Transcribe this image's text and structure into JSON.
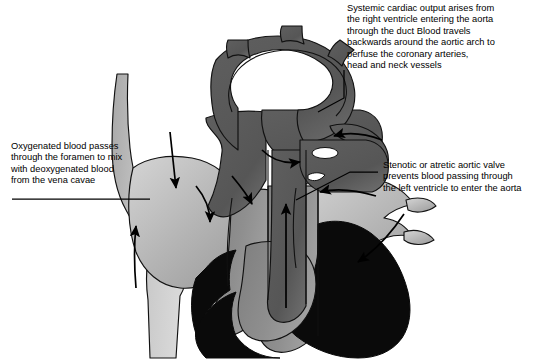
{
  "figure": {
    "type": "medical-diagram",
    "background_color": "#ffffff"
  },
  "annotations": {
    "systemic_output": {
      "name": "systemic-cardiac-output-note",
      "lines": [
        "Systemic cardiac output arises from",
        "the right ventricle entering the aorta",
        "through the duct Blood travels",
        "backwards around the aortic arch to",
        "perfuse the coronary arteries,",
        "head and neck vessels"
      ]
    },
    "foramen": {
      "name": "oxygenated-blood-foramen-note",
      "lines": [
        "Oxygenated blood passes",
        "through the foramen to mix",
        "with deoxygenated blood",
        "from the vena cavae"
      ]
    },
    "stenotic_valve": {
      "name": "stenotic-atretic-aortic-valve-note",
      "lines": [
        "Stenotic or atretic aortic valve",
        "prevents blood passing through",
        "the left ventricle to enter the aorta"
      ]
    }
  },
  "palette": {
    "light_gray": "#b9b9b9",
    "mid_gray": "#8f8f8f",
    "dark_gray": "#5c5c5c",
    "darker_gray": "#4a4a4a",
    "black": "#000000",
    "white": "#ffffff",
    "outline": "#111111"
  },
  "structures": [
    {
      "name": "aortic-arch",
      "shade": "dark_gray"
    },
    {
      "name": "brachiocephalic-artery",
      "shade": "dark_gray"
    },
    {
      "name": "left-common-carotid-artery",
      "shade": "dark_gray"
    },
    {
      "name": "left-subclavian-artery",
      "shade": "dark_gray"
    },
    {
      "name": "ascending-aorta",
      "shade": "dark_gray"
    },
    {
      "name": "descending-aorta",
      "shade": "dark_gray"
    },
    {
      "name": "ductus-arteriosus",
      "shade": "dark_gray"
    },
    {
      "name": "main-pulmonary-artery",
      "shade": "dark_gray"
    },
    {
      "name": "right-pulmonary-artery",
      "shade": "dark_gray"
    },
    {
      "name": "superior-vena-cava",
      "shade": "light_gray"
    },
    {
      "name": "inferior-vena-cava",
      "shade": "light_gray"
    },
    {
      "name": "right-atrium",
      "shade": "light_gray"
    },
    {
      "name": "left-atrium",
      "shade": "light_gray"
    },
    {
      "name": "pulmonary-veins",
      "shade": "light_gray"
    },
    {
      "name": "right-ventricle",
      "shade": "mid_gray"
    },
    {
      "name": "left-ventricle-hypoplastic",
      "shade": "mid_gray"
    },
    {
      "name": "myocardium",
      "shade": "black"
    }
  ],
  "flow_arrows": [
    {
      "name": "flow-arrow-svc-down",
      "direction": "down"
    },
    {
      "name": "flow-arrow-ivc-up",
      "direction": "up"
    },
    {
      "name": "flow-arrow-foramen-right",
      "direction": "down-right"
    },
    {
      "name": "flow-arrow-right-atrium-down",
      "direction": "down"
    },
    {
      "name": "flow-arrow-rv-outflow-up",
      "direction": "up"
    },
    {
      "name": "flow-arrow-duct-to-arch",
      "direction": "left-down"
    },
    {
      "name": "flow-arrow-retrograde-arch",
      "direction": "right"
    },
    {
      "name": "flow-arrow-pulmonary-veins-left",
      "direction": "left"
    },
    {
      "name": "flow-arrow-descending-aorta-down",
      "direction": "down"
    }
  ],
  "leader_lines": [
    {
      "name": "leader-systemic-output",
      "from": "systemic_output",
      "to": "ductus-arteriosus"
    },
    {
      "name": "leader-foramen",
      "from": "foramen",
      "to": "right-atrium"
    },
    {
      "name": "leader-stenotic-valve",
      "from": "stenotic_valve",
      "to": "aortic-valve"
    }
  ]
}
